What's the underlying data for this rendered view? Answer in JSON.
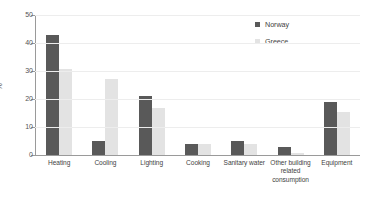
{
  "chart_data": {
    "type": "bar",
    "title": "",
    "xlabel": "",
    "ylabel": "%",
    "ylim": [
      0,
      50
    ],
    "yticks": [
      0,
      10,
      20,
      30,
      40,
      50
    ],
    "grid": true,
    "legend_position": "top-right",
    "categories": [
      "Heating",
      "Cooling",
      "Lighting",
      "Cooking",
      "Sanitary water",
      "Other building related consumption",
      "Equipment"
    ],
    "series": [
      {
        "name": "Norway",
        "color": "#595959",
        "values": [
          42.7,
          5.0,
          21.0,
          4.0,
          5.0,
          3.0,
          18.9
        ]
      },
      {
        "name": "Greece",
        "color": "#e3e3e3",
        "values": [
          30.7,
          27.0,
          16.7,
          3.8,
          3.8,
          0.6,
          15.5
        ]
      }
    ]
  }
}
